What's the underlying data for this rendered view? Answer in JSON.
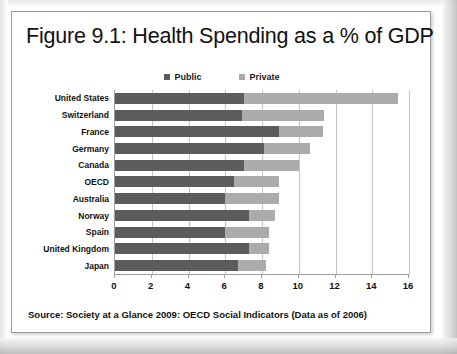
{
  "figure": {
    "title": "Figure 9.1: Health Spending as a % of GDP",
    "source_note": "Source: Society at a Glance 2009: OECD Social Indicators (Data as of 2006)"
  },
  "colors": {
    "public": "#5c5c5c",
    "private": "#ababab",
    "axis": "#9e9e9e",
    "grid": "#c4c4c4",
    "text": "#111111",
    "frame": "#9a9a9a",
    "page_background": "#ffffff"
  },
  "legend": {
    "position": "top-center",
    "entries": [
      {
        "label": "Public",
        "color": "#5c5c5c",
        "swatch": "square-swatch"
      },
      {
        "label": "Private",
        "color": "#ababab",
        "swatch": "square-swatch"
      }
    ]
  },
  "chart_data": {
    "type": "bar",
    "orientation": "horizontal",
    "stacked": true,
    "title": "Figure 9.1: Health Spending as a % of GDP",
    "subtitle": "",
    "xlabel": "",
    "ylabel": "",
    "xlim": [
      0,
      16
    ],
    "ylim": null,
    "grid": true,
    "grid_axis": "x",
    "xticks": [
      0,
      2,
      4,
      6,
      8,
      10,
      12,
      14,
      16
    ],
    "xticklabels": [
      "0",
      "2",
      "4",
      "6",
      "8",
      "10",
      "12",
      "14",
      "16"
    ],
    "categories": [
      "United States",
      "Switzerland",
      "France",
      "Germany",
      "Canada",
      "OECD",
      "Australia",
      "Norway",
      "Spain",
      "United Kingdom",
      "Japan"
    ],
    "series": [
      {
        "name": "Public",
        "color": "#5c5c5c",
        "values": [
          7.0,
          6.9,
          8.9,
          8.1,
          7.0,
          6.5,
          6.0,
          7.3,
          6.0,
          7.3,
          6.7
        ]
      },
      {
        "name": "Private",
        "color": "#ababab",
        "values": [
          8.4,
          4.5,
          2.4,
          2.5,
          3.0,
          2.4,
          2.9,
          1.4,
          2.4,
          1.1,
          1.5
        ]
      }
    ],
    "totals": [
      15.4,
      11.4,
      11.3,
      10.6,
      10.0,
      8.9,
      8.9,
      8.7,
      8.4,
      8.4,
      8.2
    ],
    "units": "% of GDP",
    "annotations": [],
    "source": "Society at a Glance 2009: OECD Social Indicators (Data as of 2006)"
  }
}
